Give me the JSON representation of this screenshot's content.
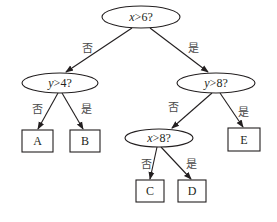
{
  "diagram": {
    "type": "decision-tree",
    "colors": {
      "stroke": "#231f20",
      "text": "#231f20",
      "label": "#4a4a4a",
      "background": "#ffffff"
    },
    "nodes": {
      "root": {
        "var": "x",
        "rest": ">6?"
      },
      "left": {
        "var": "y",
        "rest": ">4?"
      },
      "right": {
        "var": "y",
        "rest": ">8?"
      },
      "right_left": {
        "var": "x",
        "rest": ">8?"
      }
    },
    "leaves": {
      "A": "A",
      "B": "B",
      "C": "C",
      "D": "D",
      "E": "E"
    },
    "edge_labels": {
      "no": "否",
      "yes": "是"
    }
  }
}
